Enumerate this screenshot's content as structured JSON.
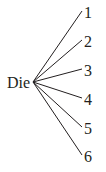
{
  "diagram": {
    "type": "tree",
    "root": {
      "label": "Die",
      "x": 33,
      "y": 82
    },
    "branches": [
      {
        "label": "1",
        "x": 82,
        "y": 11
      },
      {
        "label": "2",
        "x": 82,
        "y": 40
      },
      {
        "label": "3",
        "x": 82,
        "y": 69
      },
      {
        "label": "4",
        "x": 82,
        "y": 98
      },
      {
        "label": "5",
        "x": 82,
        "y": 127
      },
      {
        "label": "6",
        "x": 82,
        "y": 155
      }
    ],
    "line_color": "#231f20",
    "text_color": "#231f20"
  }
}
